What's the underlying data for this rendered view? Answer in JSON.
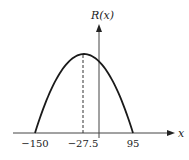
{
  "chart_data": {
    "type": "line",
    "title": "",
    "xlabel": "x",
    "ylabel": "R(x)",
    "series": [
      {
        "name": "R(x)",
        "shape": "downward parabola",
        "roots": [
          -150,
          95
        ],
        "vertex_x": -27.5
      }
    ],
    "x_tick_labels": [
      "−150",
      "−27.5",
      "95"
    ],
    "x_ticks": [
      -150,
      -27.5,
      95
    ],
    "annotations": [
      {
        "type": "dashed vertical line",
        "x": -27.5,
        "label": "vertex"
      }
    ],
    "grid": false,
    "legend": "none"
  },
  "labels": {
    "y_axis": "R(x)",
    "x_axis": "x",
    "tick_left": "−150",
    "tick_mid": "−27.5",
    "tick_right": "95"
  },
  "colors": {
    "curve": "#1a1a1a",
    "axis": "#333333",
    "text": "#222222"
  }
}
